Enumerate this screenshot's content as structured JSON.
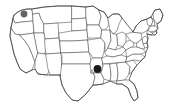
{
  "figure": {
    "kind": "map",
    "region": "Contiguous United States",
    "background_color": "#ffffff",
    "width": 170,
    "height": 108
  },
  "map": {
    "style": {
      "state_fill": "#ffffff",
      "state_border_color": "#4a4a4a",
      "state_border_width": 0.55,
      "nation_border_color": "#3a3a3a",
      "nation_border_width": 0.75,
      "labels_shown": false,
      "legend_shown": false,
      "graticule_shown": false
    },
    "markers": [
      {
        "id": "marker-washington",
        "name": "washington-marker",
        "state": "Washington",
        "shape": "circle",
        "color": "#636363",
        "radius": 3.4,
        "x": 24.0,
        "y": 14.0
      },
      {
        "id": "marker-arkansas",
        "name": "arkansas-marker",
        "state": "Arkansas",
        "shape": "circle",
        "color": "#1a1a1a",
        "radius": 3.9,
        "x": 97.5,
        "y": 69.0
      }
    ],
    "marker_count": 2
  }
}
